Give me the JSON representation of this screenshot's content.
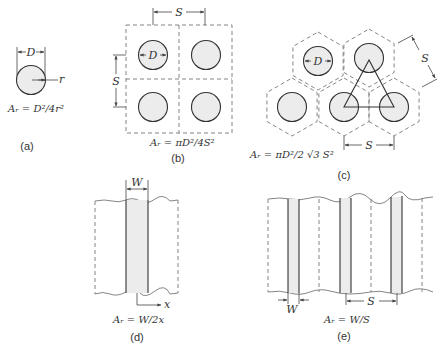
{
  "panels": {
    "a": {
      "label": "(a)",
      "dim_d": "D",
      "dim_r": "r",
      "formula": "Aᵣ = D²/4r²"
    },
    "b": {
      "label": "(b)",
      "dim_s_top": "S",
      "dim_s_left": "S",
      "dim_d": "D",
      "formula": "Aᵣ = πD²/4S²"
    },
    "c": {
      "label": "(c)",
      "dim_d": "D",
      "dim_s_diag": "S",
      "dim_s_bottom": "S",
      "formula": "Aᵣ = πD²/2 √3 S²"
    },
    "d": {
      "label": "(d)",
      "dim_w": "W",
      "axis_x": "x",
      "formula": "Aᵣ = W/2x"
    },
    "e": {
      "label": "(e)",
      "dim_w": "W",
      "dim_s": "S",
      "formula": "Aᵣ = W/S"
    }
  }
}
